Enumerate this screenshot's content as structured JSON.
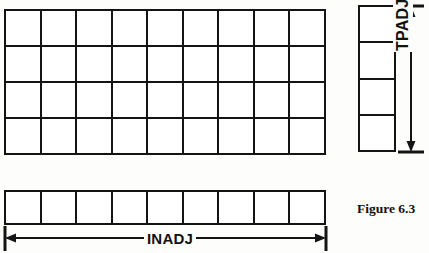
{
  "figure": {
    "caption": "Figure 6.3",
    "background_color": "#fdfdfc",
    "line_color": "#141414"
  },
  "main_grid": {
    "name": "main-cell-array",
    "columns": 9,
    "rows": 4,
    "cell_count": 36,
    "cells": [
      "",
      "",
      "",
      "",
      "",
      "",
      "",
      "",
      "",
      "",
      "",
      "",
      "",
      "",
      "",
      "",
      "",
      "",
      "",
      "",
      "",
      "",
      "",
      "",
      "",
      "",
      "",
      "",
      "",
      "",
      "",
      "",
      "",
      "",
      "",
      ""
    ]
  },
  "tpadj_grid": {
    "name": "tpadj-cell-column",
    "columns": 1,
    "rows": 4,
    "cell_count": 4,
    "cells": [
      "",
      "",
      "",
      ""
    ]
  },
  "inadj_grid": {
    "name": "inadj-cell-row",
    "columns": 9,
    "rows": 1,
    "cell_count": 9,
    "cells": [
      "",
      "",
      "",
      "",
      "",
      "",
      "",
      "",
      ""
    ]
  },
  "dimensions": {
    "vertical": {
      "label": "TPADJ",
      "orientation": "vertical",
      "arrow_style": "double-headed"
    },
    "horizontal": {
      "label": "INADJ",
      "orientation": "horizontal",
      "arrow_style": "double-headed"
    }
  }
}
